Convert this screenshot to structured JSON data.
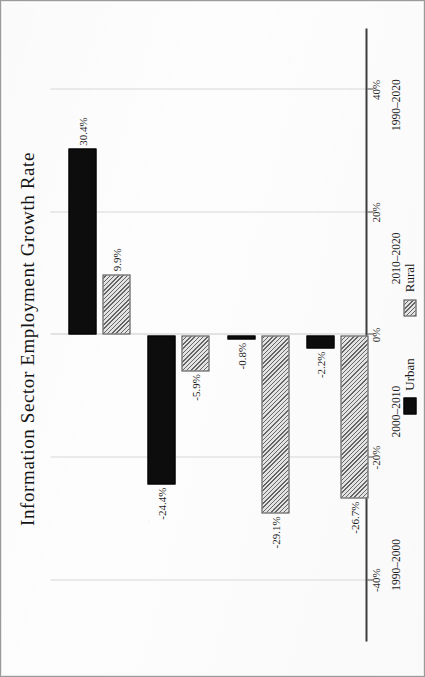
{
  "chart_data": {
    "type": "bar",
    "orientation": "horizontal-grouped-rotated",
    "title": "Information Sector Employment Growth Rate",
    "xlabel": "",
    "ylabel": "",
    "categories": [
      "1990–2000",
      "2000–2010",
      "2010–2020",
      "1990–2020"
    ],
    "series": [
      {
        "name": "Urban",
        "color": "#0d0d0d",
        "fill": "solid",
        "values": [
          30.4,
          -24.4,
          -0.8,
          -2.2
        ],
        "labels": [
          "30.4%",
          "-24.4%",
          "-0.8%",
          "-2.2%"
        ]
      },
      {
        "name": "Rural",
        "color": "#e3e3e3",
        "fill": "hatched-diagonal",
        "values": [
          9.9,
          -5.9,
          -29.1,
          -26.7
        ],
        "labels": [
          "9.9%",
          "-5.9%",
          "-29.1%",
          "-26.7%"
        ]
      }
    ],
    "axis": {
      "ticks": [
        40,
        20,
        0,
        -20,
        -40
      ],
      "tick_labels": [
        "40%",
        "20%",
        "0%",
        "-20%",
        "-40%"
      ],
      "limits": [
        -50,
        50
      ],
      "grid": true
    },
    "legend": {
      "position": "bottom",
      "entries": [
        "Urban",
        "Rural"
      ]
    }
  },
  "legend": {
    "urban_label": "Urban",
    "rural_label": "Rural"
  }
}
